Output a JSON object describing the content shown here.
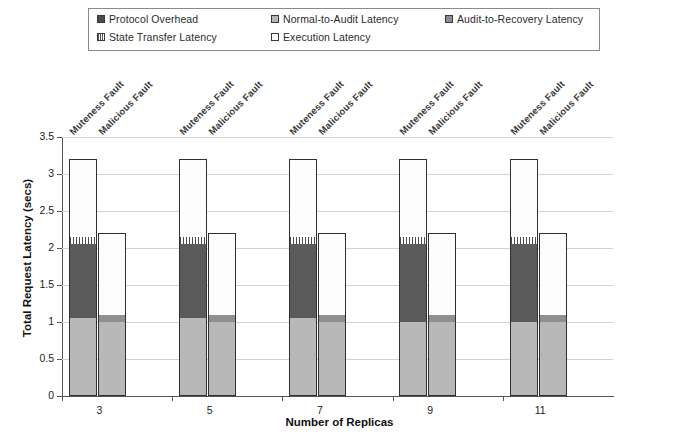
{
  "chart_data": {
    "type": "bar",
    "title": "",
    "subtitle": "",
    "xlabel": "Number of Replicas",
    "ylabel": "Total Request Latency (secs)",
    "categories": [
      "3",
      "5",
      "7",
      "9",
      "11"
    ],
    "group_labels": [
      "Muteness Fault",
      "Malicious Fault"
    ],
    "ylim": [
      0,
      3.5
    ],
    "yticks": [
      "0",
      "0.5",
      "1",
      "1.5",
      "2",
      "2.5",
      "3",
      "3.5"
    ],
    "ytick_values": [
      0,
      0.5,
      1,
      1.5,
      2,
      2.5,
      3,
      3.5
    ],
    "grid": true,
    "stacked": true,
    "legend_position": "top",
    "legend": [
      {
        "label": "Protocol Overhead",
        "color": "#5a5a5a",
        "pattern": "solid-dark"
      },
      {
        "label": "Normal-to-Audit Latency",
        "color": "#b8b8b8",
        "pattern": "solid-light"
      },
      {
        "label": "Audit-to-Recovery Latency",
        "color": "#8f8f8f",
        "pattern": "solid-mid"
      },
      {
        "label": "State Transfer Latency",
        "color": "#ffffff",
        "pattern": "vertical-hatch"
      },
      {
        "label": "Execution Latency",
        "color": "#ffffff",
        "pattern": "empty"
      }
    ],
    "series": [
      {
        "name": "Normal-to-Audit Latency",
        "group": "Muteness Fault",
        "values": [
          1.05,
          1.05,
          1.05,
          1.0,
          1.0
        ]
      },
      {
        "name": "Protocol Overhead",
        "group": "Muteness Fault",
        "values": [
          1.0,
          1.0,
          1.0,
          1.05,
          1.05
        ]
      },
      {
        "name": "State Transfer Latency",
        "group": "Muteness Fault",
        "values": [
          0.1,
          0.1,
          0.1,
          0.1,
          0.1
        ]
      },
      {
        "name": "Execution Latency",
        "group": "Muteness Fault",
        "values": [
          1.05,
          1.05,
          1.05,
          1.05,
          1.05
        ]
      },
      {
        "name": "Normal-to-Audit Latency",
        "group": "Malicious Fault",
        "values": [
          1.0,
          1.0,
          1.0,
          1.0,
          1.0
        ]
      },
      {
        "name": "Audit-to-Recovery Latency",
        "group": "Malicious Fault",
        "values": [
          0.1,
          0.1,
          0.1,
          0.1,
          0.1
        ]
      },
      {
        "name": "Execution Latency",
        "group": "Malicious Fault",
        "values": [
          1.1,
          1.1,
          1.1,
          1.1,
          1.1
        ]
      }
    ],
    "totals": {
      "Muteness Fault": [
        3.2,
        3.2,
        3.2,
        3.2,
        3.2
      ],
      "Malicious Fault": [
        2.2,
        2.2,
        2.2,
        2.2,
        2.2
      ]
    }
  }
}
